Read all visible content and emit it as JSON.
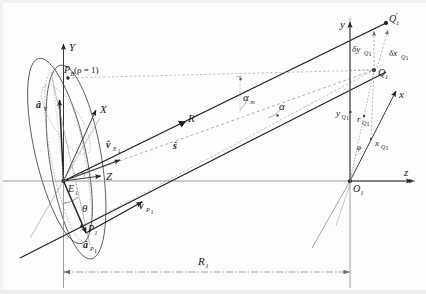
{
  "figure": {
    "background": "#fdfdfd",
    "line_color": "#2b2b2b",
    "dashed_color": "#7a7a7a",
    "axis_color": "#6e6e6e"
  },
  "left_frame": {
    "origin_label": "E",
    "origin_sub": "1",
    "axis_Y": "Y",
    "axis_X": "X",
    "axis_Z": "Z",
    "point_PB": "P",
    "point_PB_sub": "B",
    "point_PB_paren": "(ρ = 1)",
    "point_P1": "P",
    "point_P1_sub": "1",
    "vec_aY": "â",
    "vec_aY_sub": "Y",
    "vec_aP1": "â",
    "vec_aP1_sub": "P",
    "vec_aP1_sub2": "1",
    "vec_vE1": "v̂",
    "vec_vE1_sub": "E",
    "vec_vE1_sub2": "1",
    "vec_vP1": "v̂",
    "vec_vP1_sub": "P",
    "vec_vP1_sub2": "1",
    "angle_theta": "θ"
  },
  "right_frame": {
    "origin_label": "O",
    "origin_sub": "1",
    "axis_y": "y",
    "axis_x": "x",
    "axis_z": "z",
    "point_Q1": "Q",
    "point_Q1_sub": "1",
    "point_Q1p": "Q",
    "point_Q1p_prime": "′",
    "point_Q1p_sub": "1",
    "delta_y": "δy",
    "delta_y_sub": "Q",
    "delta_y_sub2": "1",
    "delta_x": "δx",
    "delta_x_sub": "Q",
    "delta_x_sub2": "1",
    "y_Q1": "y",
    "y_Q1_sub": "Q",
    "y_Q1_sub2": "1",
    "r_Q1": "r",
    "r_Q1_sub": "Q",
    "r_Q1_sub2": "1",
    "x_Q1": "x",
    "x_Q1_sub": "Q",
    "x_Q1_sub2": "1",
    "angle_phi": "φ"
  },
  "middle": {
    "range_R": "R",
    "unit_s": "ŝ",
    "angle_alpha_m": "α",
    "angle_alpha_m_sub": "m",
    "angle_alpha": "α"
  },
  "bottom": {
    "baseline_R1": "R",
    "baseline_R1_sub": "1"
  }
}
